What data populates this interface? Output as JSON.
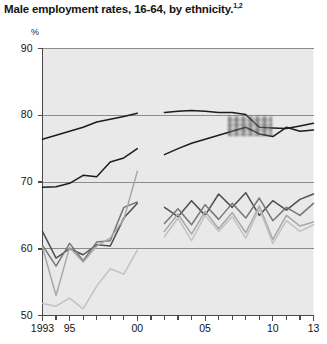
{
  "title": "Male employment rates, 16-64, by ethnicity.",
  "title_superscript": "1,2",
  "y_unit": "%",
  "ytick_labels": [
    "90",
    "80",
    "70",
    "60",
    "50"
  ],
  "xtick_labels": [
    "1993",
    "95",
    "00",
    "05",
    "10",
    "13"
  ],
  "colors": {
    "plot_background": "#e9e9e9",
    "axis": "#4a4a4a",
    "gridline": "#8c8c8c",
    "series_black": "#1c1c1c",
    "series_dark_gray": "#4f4f4f",
    "series_mid_gray": "#767676",
    "series_light_gray": "#a8a8a8",
    "series_pale_gray": "#c2c2c2"
  },
  "chart_data": {
    "type": "line",
    "title": "Male employment rates, 16-64, by ethnicity.",
    "xlabel": "",
    "ylabel": "%",
    "ylim": [
      50,
      90
    ],
    "xlim": [
      1993,
      2013
    ],
    "yticks": [
      50,
      60,
      70,
      80,
      90
    ],
    "xticks": [
      1993,
      1995,
      2000,
      2005,
      2010,
      2013
    ],
    "grid": "horizontal",
    "legend": "none",
    "note": "Series are split into two periods with a discontinuity between 2000 and 2002 (survey break).",
    "series": [
      {
        "name": "White",
        "color": "#1c1c1c",
        "segments": [
          {
            "x": [
              1993,
              1994,
              1995,
              1996,
              1997,
              1998,
              1999,
              2000
            ],
            "y": [
              76.4,
              77.0,
              77.6,
              78.2,
              79.0,
              79.4,
              79.8,
              80.3
            ]
          },
          {
            "x": [
              2002,
              2003,
              2004,
              2005,
              2006,
              2007,
              2008,
              2009,
              2010,
              2011,
              2012,
              2013
            ],
            "y": [
              80.4,
              80.6,
              80.7,
              80.6,
              80.4,
              80.4,
              80.1,
              78.2,
              78.1,
              78.0,
              78.4,
              78.8
            ]
          }
        ]
      },
      {
        "name": "Indian",
        "color": "#1c1c1c",
        "segments": [
          {
            "x": [
              1993,
              1994,
              1995,
              1996,
              1997,
              1998,
              1999,
              2000
            ],
            "y": [
              69.2,
              69.3,
              69.8,
              71.0,
              70.8,
              73.0,
              73.6,
              75.0
            ]
          },
          {
            "x": [
              2002,
              2003,
              2004,
              2005,
              2006,
              2007,
              2008,
              2009,
              2010,
              2011,
              2012,
              2013
            ],
            "y": [
              74.1,
              75.0,
              75.8,
              76.4,
              77.0,
              77.6,
              78.2,
              77.2,
              76.8,
              78.2,
              77.6,
              77.8
            ]
          }
        ]
      },
      {
        "name": "Mixed",
        "color": "#4f4f4f",
        "segments": [
          {
            "x": [
              1993,
              1994,
              1995,
              1996,
              1997,
              1998,
              1999,
              2000
            ],
            "y": [
              62.6,
              58.6,
              60.0,
              59.1,
              60.6,
              60.4,
              64.6,
              66.8
            ]
          },
          {
            "x": [
              2002,
              2003,
              2004,
              2005,
              2006,
              2007,
              2008,
              2009,
              2010,
              2011,
              2012,
              2013
            ],
            "y": [
              66.2,
              64.8,
              67.2,
              65.0,
              68.2,
              66.2,
              68.4,
              65.0,
              67.2,
              65.8,
              67.4,
              68.2
            ]
          }
        ]
      },
      {
        "name": "Black Caribbean",
        "color": "#767676",
        "segments": [
          {
            "x": [
              1993,
              1994,
              1995,
              1996,
              1997,
              1998,
              1999,
              2000
            ],
            "y": [
              60.5,
              57.4,
              60.8,
              58.2,
              61.0,
              61.2,
              66.2,
              67.0
            ]
          },
          {
            "x": [
              2002,
              2003,
              2004,
              2005,
              2006,
              2007,
              2008,
              2009,
              2010,
              2011,
              2012,
              2013
            ],
            "y": [
              63.8,
              66.0,
              63.6,
              66.6,
              64.4,
              66.8,
              64.6,
              67.6,
              64.2,
              66.2,
              65.0,
              66.8
            ]
          }
        ]
      },
      {
        "name": "Pakistani",
        "color": "#a8a8a8",
        "segments": [
          {
            "x": [
              1993,
              1994,
              1995,
              1996,
              1997,
              1998,
              1999,
              2000
            ],
            "y": [
              60.2,
              53.0,
              60.2,
              58.0,
              60.4,
              61.6,
              64.4,
              71.6
            ]
          },
          {
            "x": [
              2002,
              2003,
              2004,
              2005,
              2006,
              2007,
              2008,
              2009,
              2010,
              2011,
              2012,
              2013
            ],
            "y": [
              62.6,
              65.2,
              62.2,
              65.6,
              63.0,
              65.4,
              62.4,
              66.4,
              61.4,
              65.0,
              63.4,
              64.0
            ]
          }
        ]
      },
      {
        "name": "Bangladeshi",
        "color": "#c2c2c2",
        "segments": [
          {
            "x": [
              1993,
              1994,
              1995,
              1996,
              1997,
              1998,
              1999,
              2000
            ],
            "y": [
              51.8,
              51.4,
              52.6,
              51.0,
              54.4,
              57.0,
              56.2,
              59.8
            ]
          },
          {
            "x": [
              2002,
              2003,
              2004,
              2005,
              2006,
              2007,
              2008,
              2009,
              2010,
              2011,
              2012,
              2013
            ],
            "y": [
              61.8,
              64.6,
              61.2,
              65.0,
              62.6,
              64.8,
              61.6,
              66.0,
              60.8,
              64.2,
              62.6,
              63.6
            ]
          }
        ]
      }
    ]
  }
}
